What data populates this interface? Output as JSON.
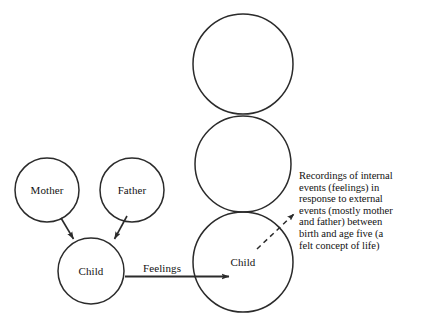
{
  "diagram": {
    "type": "concept-diagram",
    "background_color": "#ffffff",
    "stroke_color": "#2b2b2b",
    "text_color": "#131313",
    "nodes": [
      {
        "id": "mother",
        "label": "Mother",
        "cx": 47,
        "cy": 190,
        "r": 32
      },
      {
        "id": "father",
        "label": "Father",
        "cx": 132,
        "cy": 190,
        "r": 32
      },
      {
        "id": "child-left",
        "label": "Child",
        "cx": 91,
        "cy": 271,
        "r": 33
      },
      {
        "id": "circle-top",
        "label": "",
        "cx": 243,
        "cy": 64,
        "r": 50
      },
      {
        "id": "circle-middle",
        "label": "",
        "cx": 243,
        "cy": 164,
        "r": 48
      },
      {
        "id": "child-right",
        "label": "Child",
        "cx": 243,
        "cy": 262,
        "r": 50
      }
    ],
    "edges": [
      {
        "id": "mother-to-child",
        "label": "",
        "style": "solid-arrow",
        "from": "mother",
        "to": "child-left"
      },
      {
        "id": "father-to-child",
        "label": "",
        "style": "solid-arrow",
        "from": "father",
        "to": "child-left"
      },
      {
        "id": "feelings",
        "label": "Feelings",
        "style": "solid-arrow",
        "from": "child-left",
        "to": "child-right"
      },
      {
        "id": "annotation-pointer",
        "label": "",
        "style": "dashed-arrow",
        "from": "annotation",
        "to": "child-right"
      }
    ],
    "annotation": {
      "id": "internal-events-note",
      "lines": [
        "Recordings of internal",
        "events (feelings) in",
        "response to external",
        "events (mostly mother",
        "and father) between",
        "birth and age five (a",
        "felt concept of life)"
      ],
      "full_text": "Recordings of internal events (feelings) in response to external events (mostly mother and father) between birth and age five (a felt concept of life)"
    }
  }
}
